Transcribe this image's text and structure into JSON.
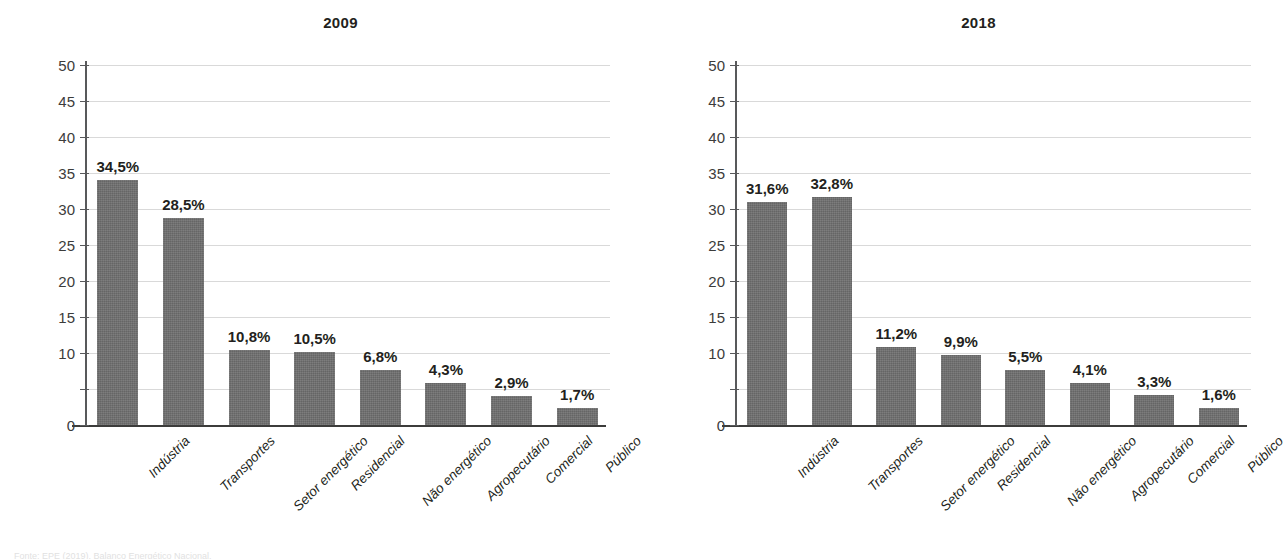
{
  "figure": {
    "background_color": "#ffffff",
    "bar_color": "#6e6e6e",
    "gridline_color": "#d9d9d9",
    "axis_color": "#3c3c3b",
    "text_color": "#231f20",
    "footer_partial_text": "Fonte: EPE (2019). Balanço Energético Nacional."
  },
  "axis": {
    "y_tick_labels": [
      "50",
      "45",
      "40",
      "35",
      "30",
      "25",
      "20",
      "15",
      "10",
      "",
      "0"
    ],
    "y_tick_values": [
      50,
      45,
      40,
      35,
      30,
      25,
      20,
      15,
      10,
      5,
      0
    ],
    "y_min": 0,
    "y_max": 50,
    "y_step": 5
  },
  "chart_data": [
    {
      "type": "bar",
      "title": "2009",
      "xlabel": "",
      "ylabel": "",
      "ylim": [
        0,
        50
      ],
      "grid": true,
      "legend": "none",
      "categories": [
        "Indústria",
        "Transportes",
        "Setor energético",
        "Residencial",
        "Não energético",
        "Agropecutário",
        "Comercial",
        "Público"
      ],
      "values": [
        34.5,
        28.5,
        10.8,
        10.5,
        6.8,
        4.3,
        2.9,
        1.7
      ],
      "drawn_values": [
        34.0,
        28.7,
        10.4,
        10.2,
        7.7,
        5.9,
        4.0,
        2.3
      ],
      "data_labels": [
        "34,5%",
        "28,5%",
        "10,8%",
        "10,5%",
        "6,8%",
        "4,3%",
        "2,9%",
        "1,7%"
      ]
    },
    {
      "type": "bar",
      "title": "2018",
      "xlabel": "",
      "ylabel": "",
      "ylim": [
        0,
        50
      ],
      "grid": true,
      "legend": "none",
      "categories": [
        "Indústria",
        "Transportes",
        "Setor energético",
        "Residencial",
        "Não energético",
        "Agropecutário",
        "Comercial",
        "Público"
      ],
      "values": [
        31.6,
        32.8,
        11.2,
        9.9,
        5.5,
        4.1,
        3.3,
        1.6
      ],
      "drawn_values": [
        31.0,
        31.7,
        10.9,
        9.7,
        7.7,
        5.9,
        4.1,
        2.3
      ],
      "data_labels": [
        "31,6%",
        "32,8%",
        "11,2%",
        "9,9%",
        "5,5%",
        "4,1%",
        "3,3%",
        "1,6%"
      ]
    }
  ]
}
